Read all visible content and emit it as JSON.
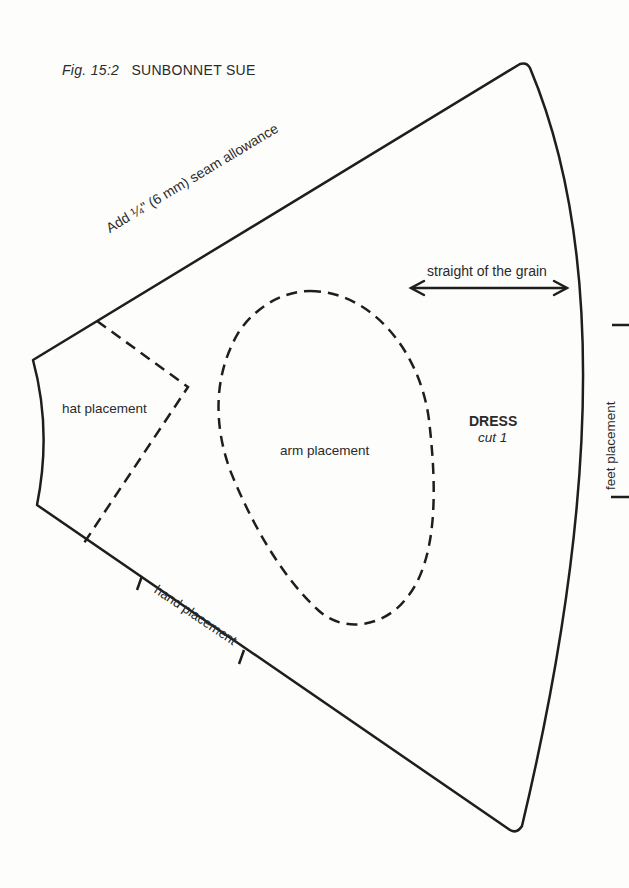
{
  "figure": {
    "number": "Fig. 15:2",
    "title": "SUNBONNET SUE"
  },
  "pattern_piece": {
    "name": "DRESS",
    "instruction": "cut 1",
    "seam_note": "Add ¼\" (6 mm) seam allowance",
    "grain_label": "straight of the grain",
    "placements": {
      "hat": "hat placement",
      "arm": "arm placement",
      "hand": "hand placement",
      "feet": "feet placement"
    }
  },
  "colors": {
    "line": "#1e1e1e",
    "background": "#fdfdfc"
  }
}
